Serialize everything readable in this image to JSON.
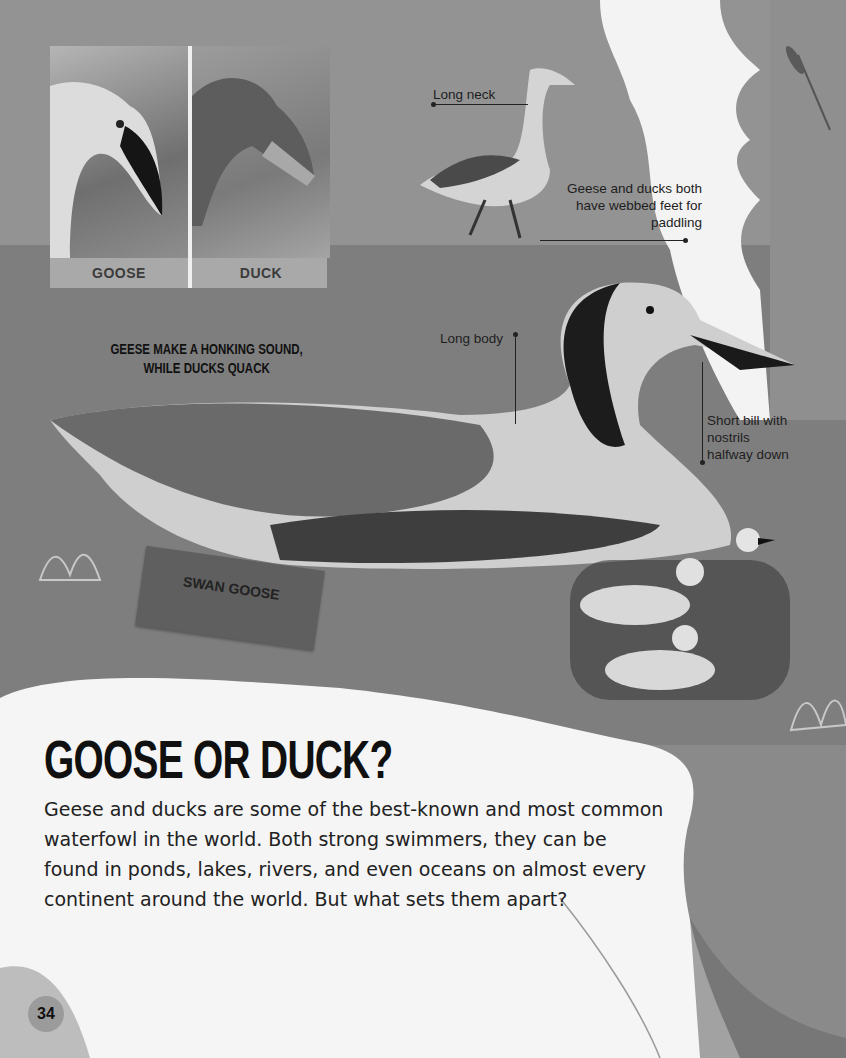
{
  "page": {
    "number": "34",
    "title": "GOOSE OR DUCK?",
    "intro": "Geese and ducks are some of the best-known and most common waterfowl in the world. Both strong swimmers, they can be found in ponds, lakes, rivers, and even oceans on almost every continent around the world. But what sets them apart?"
  },
  "comparison": {
    "photos": [
      {
        "label": "GOOSE"
      },
      {
        "label": "DUCK"
      }
    ]
  },
  "fact": "GEESE MAKE A HONKING SOUND, WHILE DUCKS QUACK",
  "callouts": {
    "long_neck": "Long neck",
    "webbed_feet": "Geese and ducks both have webbed feet for paddling",
    "long_body": "Long body",
    "short_bill": "Short bill with nostrils halfway down"
  },
  "sign": {
    "label": "SWAN GOOSE"
  },
  "colors": {
    "background": "#939393",
    "water": "#7e7e7e",
    "card": "#f5f5f5",
    "text": "#101010"
  }
}
